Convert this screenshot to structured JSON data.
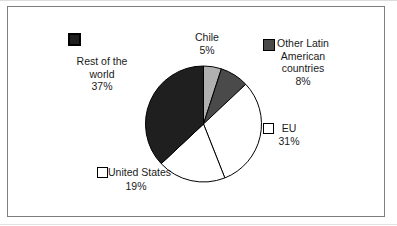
{
  "chart_data": {
    "type": "pie",
    "title": "",
    "categories": [
      "Chile",
      "Other Latin American countries",
      "EU",
      "United States",
      "Rest of the world"
    ],
    "values": [
      5,
      8,
      31,
      19,
      37
    ],
    "unit": "%",
    "start_angle_deg": 0,
    "direction": "clockwise",
    "outline_color": "#000000",
    "legend_position": "around-labels",
    "slices": [
      {
        "id": "chile",
        "label": "Chile",
        "value": 5,
        "color": "#b0b0b0",
        "has_swatch": false
      },
      {
        "id": "other-latin",
        "label": "Other Latin American countries",
        "value": 8,
        "color": "#4a4a4a",
        "has_swatch": true
      },
      {
        "id": "eu",
        "label": "EU",
        "value": 31,
        "color": "#ffffff",
        "has_swatch": true
      },
      {
        "id": "united-states",
        "label": "United States",
        "value": 19,
        "color": "#ffffff",
        "has_swatch": true
      },
      {
        "id": "rest-of-world",
        "label": "Rest of the world",
        "value": 37,
        "color": "#1f1f1f",
        "has_swatch": true
      }
    ]
  },
  "labels": {
    "chile": {
      "name": "Chile",
      "pct": "5%"
    },
    "other_latin": {
      "line1": "Other Latin",
      "line2": "American",
      "line3": "countries",
      "pct": "8%"
    },
    "eu": {
      "name": "EU",
      "pct": "31%"
    },
    "united_states": {
      "name": "United States",
      "pct": "19%"
    },
    "rest_of_world": {
      "line1": "Rest of the",
      "line2": "world",
      "pct": "37%"
    }
  }
}
